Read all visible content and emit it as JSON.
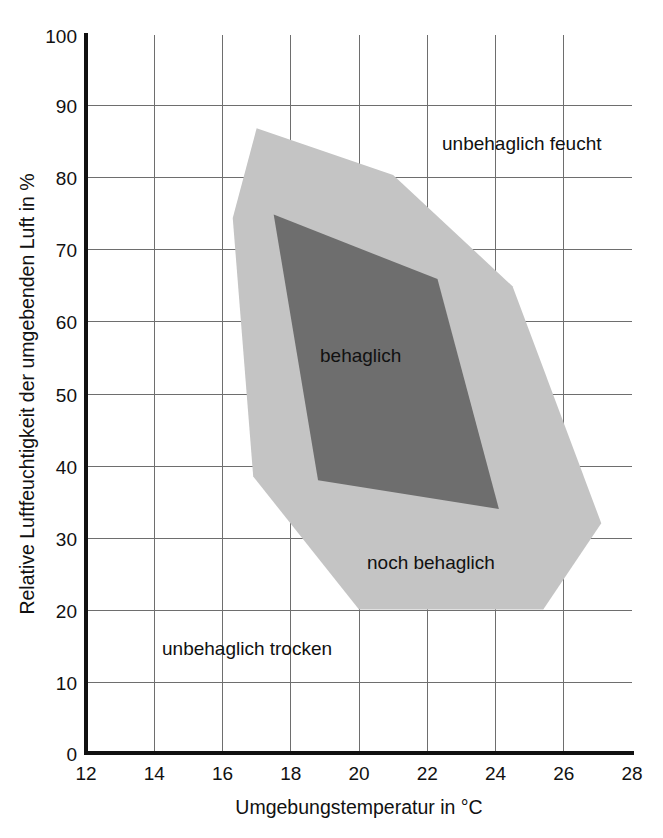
{
  "chart_data": {
    "type": "area",
    "title": "",
    "xlabel": "Umgebungstemperatur in °C",
    "ylabel": "Relative Luftfeuchtigkeit der umgebenden Luft in %",
    "xlim": [
      12,
      28
    ],
    "ylim": [
      0,
      100
    ],
    "xticks": [
      "12",
      "14",
      "16",
      "18",
      "20",
      "22",
      "24",
      "26",
      "28"
    ],
    "yticks": [
      "0",
      "10",
      "20",
      "30",
      "40",
      "50",
      "60",
      "70",
      "80",
      "90",
      "100"
    ],
    "xtick_values": [
      12,
      14,
      16,
      18,
      20,
      22,
      24,
      26,
      28
    ],
    "ytick_values": [
      0,
      10,
      20,
      30,
      40,
      50,
      60,
      70,
      80,
      90,
      100
    ],
    "grid": true,
    "legend_position": "inline-annotations",
    "colors": {
      "comfortable_fill": "#6e6e6e",
      "acceptable_fill": "#c4c4c4",
      "background": "#ffffff",
      "axis": "#111111",
      "grid": "#6e6e6e",
      "text": "#111111"
    },
    "series": [
      {
        "name": "noch behaglich",
        "fill": "#c4c4c4",
        "polygon": [
          [
            17.0,
            87.0
          ],
          [
            21.0,
            80.5
          ],
          [
            24.5,
            65.0
          ],
          [
            27.1,
            32.0
          ],
          [
            25.4,
            20.0
          ],
          [
            20.0,
            20.0
          ],
          [
            16.9,
            38.5
          ],
          [
            16.3,
            74.5
          ]
        ]
      },
      {
        "name": "behaglich",
        "fill": "#6e6e6e",
        "polygon": [
          [
            17.5,
            75.0
          ],
          [
            22.3,
            66.0
          ],
          [
            24.1,
            34.0
          ],
          [
            18.8,
            38.0
          ]
        ]
      }
    ],
    "annotations": [
      {
        "id": "unbehaglich-feucht",
        "text": "unbehaglich feucht",
        "x": 22.6,
        "y": 85.0
      },
      {
        "id": "behaglich",
        "text": "behaglich",
        "x": 20.3,
        "y": 54.5
      },
      {
        "id": "noch-behaglich",
        "text": "noch behaglich",
        "x": 22.1,
        "y": 28.5
      },
      {
        "id": "unbehaglich-trocken",
        "text": "unbehaglich trocken",
        "x": 16.8,
        "y": 14.5
      }
    ]
  },
  "labels": {
    "x_axis_title": "Umgebungstemperatur in °C",
    "y_axis_title": "Relative Luftfeuchtigkeit der umgebenden Luft in %",
    "zone_humid": "unbehaglich feucht",
    "zone_comfortable": "behaglich",
    "zone_acceptable": "noch behaglich",
    "zone_dry": "unbehaglich trocken"
  },
  "xticks": {
    "t0": "12",
    "t1": "14",
    "t2": "16",
    "t3": "18",
    "t4": "20",
    "t5": "22",
    "t6": "24",
    "t7": "26",
    "t8": "28"
  },
  "yticks": {
    "t0": "0",
    "t1": "10",
    "t2": "20",
    "t3": "30",
    "t4": "40",
    "t5": "50",
    "t6": "60",
    "t7": "70",
    "t8": "80",
    "t9": "90",
    "t10": "100"
  }
}
